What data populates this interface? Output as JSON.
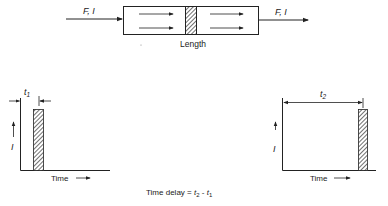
{
  "top_diagram": {
    "input_label": "F, I",
    "output_label": "F, I",
    "length_label": "Length"
  },
  "left_plot": {
    "time_label": "t",
    "time_subscript": "1",
    "y_label": "I",
    "x_label": "Time"
  },
  "right_plot": {
    "time_label": "t",
    "time_subscript": "2",
    "y_label": "I",
    "x_label": "Time"
  },
  "caption": {
    "prefix": "Time delay = ",
    "t2": "t",
    "t2_sub": "2",
    "minus": " - ",
    "t1": "t",
    "t1_sub": "1"
  },
  "colors": {
    "stroke": "#222222",
    "background": "#ffffff"
  }
}
